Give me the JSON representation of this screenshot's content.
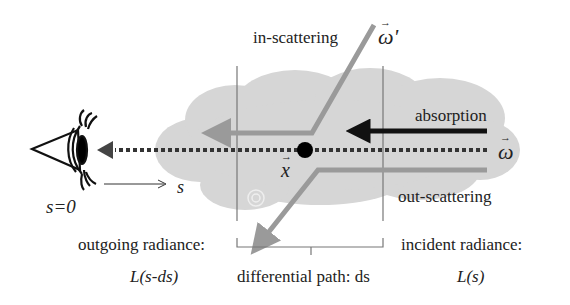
{
  "diagram": {
    "labels": {
      "in_scattering": "in-scattering",
      "absorption": "absorption",
      "out_scattering": "out-scattering",
      "outgoing_radiance": "outgoing radiance:",
      "incident_radiance": "incident radiance:",
      "differential_path": "differential path: ds",
      "L_out": "L(s-ds)",
      "L_in": "L(s)",
      "s_origin": "s=0",
      "s_axis": "s",
      "x_point": "x",
      "omega": "ω",
      "omega_prime": "ω'"
    },
    "colors": {
      "cloud": "#d6d6d6",
      "gray_arrow": "#9a9a9a",
      "black_arrow": "#111111",
      "bracket_lines": "#777777",
      "text": "#222222"
    },
    "icons": [
      "eye-icon",
      "cloud-shape",
      "point-x-dot"
    ]
  }
}
